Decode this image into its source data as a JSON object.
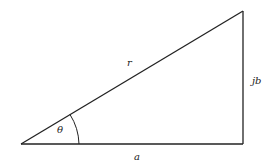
{
  "diagram": {
    "type": "right-triangle",
    "labels": {
      "hypotenuse": "r",
      "adjacent": "a",
      "opposite": "jb",
      "angle": "θ"
    },
    "vertices": {
      "origin": [
        21,
        144
      ],
      "right_angle": [
        243,
        144
      ],
      "top": [
        243,
        11
      ]
    },
    "stroke_color": "#222222",
    "background": "#ffffff"
  }
}
